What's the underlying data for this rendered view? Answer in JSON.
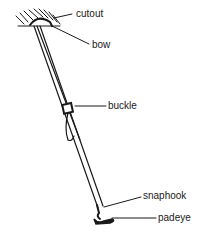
{
  "diagram": {
    "type": "labeled line illustration",
    "stroke_color": "#1a1a1a",
    "background_color": "#ffffff",
    "labels": [
      {
        "id": "cutout",
        "text": "cutout"
      },
      {
        "id": "bow",
        "text": "bow"
      },
      {
        "id": "buckle",
        "text": "buckle"
      },
      {
        "id": "snaphook",
        "text": "snaphook"
      },
      {
        "id": "padeye",
        "text": "padeye"
      }
    ]
  }
}
